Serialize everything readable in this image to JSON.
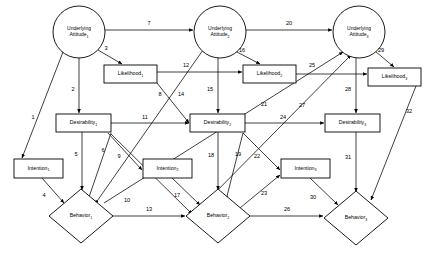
{
  "diagram": {
    "type": "path-diagram",
    "nodes": [
      {
        "id": "ua1",
        "shape": "circle",
        "line1": "Underlying",
        "line2": "Attitude",
        "sub": "1",
        "cx": 79,
        "cy": 32,
        "r": 26
      },
      {
        "id": "ua2",
        "shape": "circle",
        "line1": "Underlying",
        "line2": "Attitude",
        "sub": "2",
        "cx": 220,
        "cy": 32,
        "r": 26
      },
      {
        "id": "ua3",
        "shape": "circle",
        "line1": "Underlying",
        "line2": "Attitude",
        "sub": "3",
        "cx": 359,
        "cy": 32,
        "r": 26
      },
      {
        "id": "lk1",
        "shape": "rect",
        "line1": "Likelihood",
        "sub": "1",
        "x": 104,
        "y": 65,
        "w": 53,
        "h": 18
      },
      {
        "id": "lk2",
        "shape": "rect",
        "line1": "Likelihood",
        "sub": "2",
        "x": 243,
        "y": 65,
        "w": 53,
        "h": 18
      },
      {
        "id": "lk3",
        "shape": "rect",
        "line1": "Likelihood",
        "sub": "3",
        "x": 368,
        "y": 68,
        "w": 53,
        "h": 18
      },
      {
        "id": "ds1",
        "shape": "rect",
        "line1": "Desirability",
        "sub": "1",
        "x": 56,
        "y": 114,
        "w": 55,
        "h": 18
      },
      {
        "id": "ds2",
        "shape": "rect",
        "line1": "Desirability",
        "sub": "2",
        "x": 190,
        "y": 114,
        "w": 55,
        "h": 18
      },
      {
        "id": "ds3",
        "shape": "rect",
        "line1": "Desirability",
        "sub": "3",
        "x": 325,
        "y": 114,
        "w": 55,
        "h": 18
      },
      {
        "id": "in1",
        "shape": "rect",
        "line1": "Intention",
        "sub": "1",
        "x": 14,
        "y": 159,
        "w": 49,
        "h": 19
      },
      {
        "id": "in2",
        "shape": "rect",
        "line1": "Intention",
        "sub": "2",
        "x": 143,
        "y": 159,
        "w": 49,
        "h": 19
      },
      {
        "id": "in3",
        "shape": "rect",
        "line1": "Intention",
        "sub": "3",
        "x": 281,
        "y": 159,
        "w": 49,
        "h": 19
      },
      {
        "id": "bh1",
        "shape": "diamond",
        "line1": "Behavior",
        "sub": "1",
        "cx": 81,
        "cy": 216,
        "rx": 32,
        "ry": 27
      },
      {
        "id": "bh2",
        "shape": "diamond",
        "line1": "Behavior",
        "sub": "2",
        "cx": 218,
        "cy": 216,
        "rx": 32,
        "ry": 27
      },
      {
        "id": "bh3",
        "shape": "diamond",
        "line1": "Behavior",
        "sub": "3",
        "cx": 356,
        "cy": 218,
        "rx": 32,
        "ry": 27
      }
    ],
    "edges": [
      {
        "id": 1,
        "label": "1",
        "from": "ua1",
        "to": "in1",
        "x1": 63,
        "y1": 52,
        "x2": 22,
        "y2": 158,
        "lx": 33,
        "ly": 118
      },
      {
        "id": 2,
        "label": "2",
        "from": "ua1",
        "to": "ds1",
        "x1": 79,
        "y1": 58,
        "x2": 79,
        "y2": 113,
        "lx": 73,
        "ly": 90
      },
      {
        "id": 3,
        "label": "3",
        "from": "ua1",
        "to": "lk1",
        "x1": 98,
        "y1": 50,
        "x2": 122,
        "y2": 64,
        "lx": 106,
        "ly": 49
      },
      {
        "id": 4,
        "label": "4",
        "from": "in1",
        "to": "bh1",
        "x1": 42,
        "y1": 178,
        "x2": 64,
        "y2": 203,
        "lx": 44,
        "ly": 196
      },
      {
        "id": 5,
        "label": "5",
        "from": "ds1",
        "to": "bh1",
        "x1": 82,
        "y1": 132,
        "x2": 82,
        "y2": 190,
        "lx": 76,
        "ly": 155
      },
      {
        "id": 6,
        "label": "6",
        "from": "ds1",
        "to": "bh1",
        "x1": 111,
        "y1": 133,
        "x2": 88,
        "y2": 200,
        "lx": 103,
        "ly": 151
      },
      {
        "id": 7,
        "label": "7",
        "from": "ua1",
        "to": "ua2",
        "x1": 105,
        "y1": 30,
        "x2": 193,
        "y2": 30,
        "lx": 149,
        "ly": 24
      },
      {
        "id": 8,
        "label": "8",
        "from": "lk1",
        "to": "ds2",
        "x1": 157,
        "y1": 83,
        "x2": 189,
        "y2": 123,
        "lx": 160,
        "ly": 95
      },
      {
        "id": 9,
        "label": "9",
        "from": "ds1",
        "to": "in2",
        "x1": 108,
        "y1": 133,
        "x2": 142,
        "y2": 170,
        "lx": 119,
        "ly": 157
      },
      {
        "id": 10,
        "label": "10",
        "from": "ds1",
        "to": "bh2",
        "x1": 111,
        "y1": 134,
        "x2": 192,
        "y2": 214,
        "lx": 127,
        "ly": 201
      },
      {
        "id": 11,
        "label": "11",
        "from": "ds1",
        "to": "ds2",
        "x1": 111,
        "y1": 123,
        "x2": 189,
        "y2": 123,
        "lx": 145,
        "ly": 118
      },
      {
        "id": 12,
        "label": "12",
        "from": "lk1",
        "to": "lk2",
        "x1": 157,
        "y1": 72,
        "x2": 242,
        "y2": 72,
        "lx": 186,
        "ly": 66
      },
      {
        "id": 13,
        "label": "13",
        "from": "bh1",
        "to": "bh2",
        "x1": 113,
        "y1": 216,
        "x2": 185,
        "y2": 216,
        "lx": 149,
        "ly": 210
      },
      {
        "id": 14,
        "label": "14",
        "from": "ua2",
        "to": "bh1",
        "x1": 203,
        "y1": 50,
        "x2": 95,
        "y2": 204,
        "lx": 181,
        "ly": 95
      },
      {
        "id": 15,
        "label": "15",
        "from": "ua2",
        "to": "ds2",
        "x1": 218,
        "y1": 58,
        "x2": 218,
        "y2": 113,
        "lx": 210,
        "ly": 90
      },
      {
        "id": 16,
        "label": "16",
        "from": "ua2",
        "to": "lk2",
        "x1": 235,
        "y1": 51,
        "x2": 260,
        "y2": 64,
        "lx": 242,
        "ly": 51
      },
      {
        "id": 17,
        "label": "17",
        "from": "in2",
        "to": "bh2",
        "x1": 172,
        "y1": 178,
        "x2": 200,
        "y2": 205,
        "lx": 177,
        "ly": 196
      },
      {
        "id": 18,
        "label": "18",
        "from": "ds2",
        "to": "bh2",
        "x1": 218,
        "y1": 132,
        "x2": 218,
        "y2": 190,
        "lx": 211,
        "ly": 156
      },
      {
        "id": 19,
        "label": "19",
        "from": "ds2",
        "to": "bh2",
        "x1": 243,
        "y1": 133,
        "x2": 226,
        "y2": 200,
        "lx": 238,
        "ly": 155
      },
      {
        "id": 20,
        "label": "20",
        "from": "ua2",
        "to": "ua3",
        "x1": 246,
        "y1": 30,
        "x2": 332,
        "y2": 30,
        "lx": 289,
        "ly": 24
      },
      {
        "id": 21,
        "label": "21",
        "from": "bh1",
        "to": "ua3",
        "x1": 104,
        "y1": 203,
        "x2": 343,
        "y2": 52,
        "lx": 264,
        "ly": 105
      },
      {
        "id": 22,
        "label": "22",
        "from": "ds2",
        "to": "in3",
        "x1": 243,
        "y1": 133,
        "x2": 280,
        "y2": 170,
        "lx": 257,
        "ly": 157
      },
      {
        "id": 23,
        "label": "23",
        "from": "bh2",
        "to": "in3",
        "x1": 240,
        "y1": 208,
        "x2": 280,
        "y2": 175,
        "lx": 264,
        "ly": 194
      },
      {
        "id": 24,
        "label": "24",
        "from": "ds2",
        "to": "ds3",
        "x1": 245,
        "y1": 123,
        "x2": 324,
        "y2": 123,
        "lx": 283,
        "ly": 118
      },
      {
        "id": 25,
        "label": "25",
        "from": "lk2",
        "to": "lk3",
        "x1": 296,
        "y1": 74,
        "x2": 367,
        "y2": 74,
        "lx": 312,
        "ly": 66
      },
      {
        "id": 26,
        "label": "26",
        "from": "bh2",
        "to": "bh3",
        "x1": 250,
        "y1": 216,
        "x2": 323,
        "y2": 216,
        "lx": 287,
        "ly": 210
      },
      {
        "id": 27,
        "label": "27",
        "from": "bh2",
        "to": "ua3",
        "x1": 202,
        "y1": 206,
        "x2": 351,
        "y2": 55,
        "lx": 302,
        "ly": 106
      },
      {
        "id": 28,
        "label": "28",
        "from": "ua3",
        "to": "ds3",
        "x1": 356,
        "y1": 58,
        "x2": 356,
        "y2": 113,
        "lx": 348,
        "ly": 90
      },
      {
        "id": 29,
        "label": "29",
        "from": "ua3",
        "to": "lk3",
        "x1": 375,
        "y1": 51,
        "x2": 394,
        "y2": 67,
        "lx": 381,
        "ly": 51
      },
      {
        "id": 30,
        "label": "30",
        "from": "in3",
        "to": "bh3",
        "x1": 310,
        "y1": 178,
        "x2": 338,
        "y2": 205,
        "lx": 313,
        "ly": 198
      },
      {
        "id": 31,
        "label": "31",
        "from": "ds3",
        "to": "bh3",
        "x1": 356,
        "y1": 132,
        "x2": 356,
        "y2": 192,
        "lx": 348,
        "ly": 158
      },
      {
        "id": 32,
        "label": "32",
        "from": "lk3",
        "to": "bh3",
        "x1": 416,
        "y1": 86,
        "x2": 371,
        "y2": 200,
        "lx": 409,
        "ly": 112
      }
    ]
  }
}
